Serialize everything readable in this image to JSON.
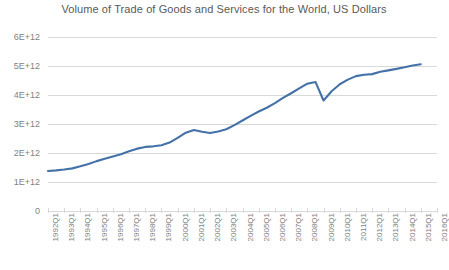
{
  "chart_data": {
    "type": "line",
    "title": "Volume of Trade of Goods and Services for the World, US Dollars",
    "xlabel": "",
    "ylabel": "",
    "grid": true,
    "legend": false,
    "legend_position": "none",
    "line_color": "#4472a8",
    "ylim": [
      0,
      6000000000000
    ],
    "ytick_labels": [
      "0",
      "1E+12",
      "2E+12",
      "3E+12",
      "4E+12",
      "5E+12",
      "6E+12"
    ],
    "ytick_values": [
      0,
      1000000000000,
      2000000000000,
      3000000000000,
      4000000000000,
      5000000000000,
      6000000000000
    ],
    "xtick_labels": [
      "1992Q1",
      "1993Q1",
      "1994Q1",
      "1995Q1",
      "1996Q1",
      "1997Q1",
      "1998Q1",
      "1999Q1",
      "2000Q1",
      "2001Q1",
      "2002Q1",
      "2003Q1",
      "2004Q1",
      "2005Q1",
      "2006Q1",
      "2007Q1",
      "2008Q1",
      "2009Q1",
      "2010Q1",
      "2011Q1",
      "2012Q1",
      "2013Q1",
      "2014Q1",
      "2015Q1",
      "2016Q1"
    ],
    "categories": [
      "1992Q1",
      "1992Q3",
      "1993Q1",
      "1993Q3",
      "1994Q1",
      "1994Q3",
      "1995Q1",
      "1995Q3",
      "1996Q1",
      "1996Q3",
      "1997Q1",
      "1997Q3",
      "1998Q1",
      "1998Q3",
      "1999Q1",
      "1999Q3",
      "2000Q1",
      "2000Q3",
      "2001Q1",
      "2001Q3",
      "2002Q1",
      "2002Q3",
      "2003Q1",
      "2003Q3",
      "2004Q1",
      "2004Q3",
      "2005Q1",
      "2005Q3",
      "2006Q1",
      "2006Q3",
      "2007Q1",
      "2007Q3",
      "2008Q1",
      "2008Q3",
      "2009Q1",
      "2009Q3",
      "2010Q1",
      "2010Q3",
      "2011Q1",
      "2011Q3",
      "2012Q1",
      "2012Q3",
      "2013Q1",
      "2013Q3",
      "2014Q1",
      "2014Q3",
      "2015Q1"
    ],
    "values": [
      1380000000000,
      1400000000000,
      1430000000000,
      1470000000000,
      1540000000000,
      1620000000000,
      1720000000000,
      1800000000000,
      1880000000000,
      1960000000000,
      2060000000000,
      2150000000000,
      2210000000000,
      2230000000000,
      2270000000000,
      2360000000000,
      2520000000000,
      2700000000000,
      2790000000000,
      2730000000000,
      2690000000000,
      2740000000000,
      2820000000000,
      2960000000000,
      3120000000000,
      3280000000000,
      3430000000000,
      3560000000000,
      3720000000000,
      3900000000000,
      4060000000000,
      4230000000000,
      4390000000000,
      4450000000000,
      3810000000000,
      4130000000000,
      4370000000000,
      4530000000000,
      4650000000000,
      4700000000000,
      4720000000000,
      4800000000000,
      4850000000000,
      4900000000000,
      4960000000000,
      5020000000000,
      5060000000000
    ],
    "units": "US Dollars",
    "annotations": []
  }
}
